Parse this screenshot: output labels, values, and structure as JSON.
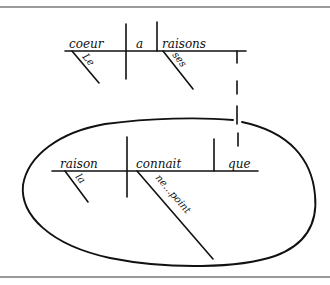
{
  "diagram": {
    "type": "sentence-diagram (Reed-Kellogg, handwritten)",
    "colors": {
      "ink": "#111111",
      "frame_rule": "#9a9a9a",
      "background": "#ffffff"
    },
    "main_clause": {
      "subject": "coeur",
      "subject_modifier": "Le",
      "verb": "a",
      "object": "raisons",
      "object_modifier": "ses"
    },
    "subordinate_clause": {
      "subject": "raison",
      "subject_modifier": "la",
      "verb": "connait",
      "verb_modifier": "ne...point",
      "object": "que"
    },
    "connector": "dashed line linking 'raisons' to 'que'",
    "enclosure": "hand-drawn oval around subordinate clause"
  }
}
